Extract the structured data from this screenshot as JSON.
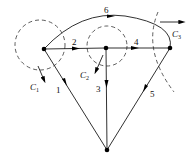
{
  "diagram": {
    "type": "directed-graph-with-cutsets",
    "nodes": [
      {
        "id": "A",
        "x": 44,
        "y": 49
      },
      {
        "id": "B",
        "x": 106,
        "y": 48
      },
      {
        "id": "C",
        "x": 170,
        "y": 48
      },
      {
        "id": "D",
        "x": 107,
        "y": 150
      }
    ],
    "edges": [
      {
        "label": "1",
        "from": "D",
        "to": "A",
        "direction": "A→D"
      },
      {
        "label": "2",
        "from": "A",
        "to": "B"
      },
      {
        "label": "3",
        "from": "B",
        "to": "D"
      },
      {
        "label": "4",
        "from": "B",
        "to": "C"
      },
      {
        "label": "5",
        "from": "C",
        "to": "D"
      },
      {
        "label": "6",
        "from": "A",
        "to": "C",
        "shape": "arc"
      }
    ],
    "cutsets": [
      {
        "label": "C",
        "subscript": "1",
        "shape": "circle",
        "around": "A"
      },
      {
        "label": "C",
        "subscript": "2",
        "shape": "circle",
        "around": "B"
      },
      {
        "label": "C",
        "subscript": "3",
        "shape": "arc",
        "near": "C"
      }
    ],
    "edge_labels": {
      "e1": "1",
      "e2": "2",
      "e3": "3",
      "e4": "4",
      "e5": "5",
      "e6": "6"
    },
    "cut_labels": {
      "c1": "C",
      "c1_sub": "1",
      "c2": "C",
      "c2_sub": "2",
      "c3": "C",
      "c3_sub": "3"
    }
  }
}
